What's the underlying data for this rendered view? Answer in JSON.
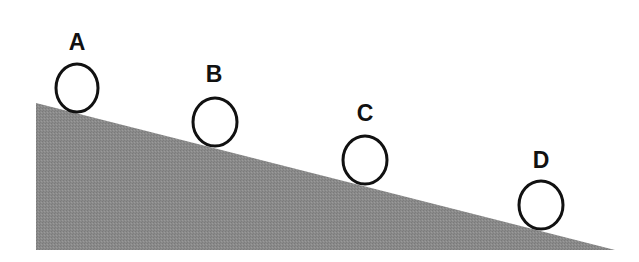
{
  "diagram": {
    "type": "inclined-plane",
    "colors": {
      "slope_fill": "#8a8a8a",
      "circle_stroke": "#111111",
      "label": "#111111",
      "background": "#ffffff"
    },
    "slope": {
      "points": "36,103 615,250 36,250"
    },
    "balls": [
      {
        "label": "A",
        "cx": 77,
        "cy": 88,
        "rx": 21,
        "ry": 24,
        "label_x": 77,
        "label_y": 50
      },
      {
        "label": "B",
        "cx": 215,
        "cy": 122,
        "rx": 22,
        "ry": 24,
        "label_x": 214,
        "label_y": 82
      },
      {
        "label": "C",
        "cx": 365,
        "cy": 160,
        "rx": 22,
        "ry": 24,
        "label_x": 365,
        "label_y": 121
      },
      {
        "label": "D",
        "cx": 541,
        "cy": 205,
        "rx": 22,
        "ry": 24,
        "label_x": 541,
        "label_y": 168
      }
    ]
  }
}
